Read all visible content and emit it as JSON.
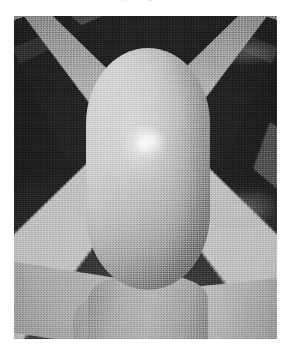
{
  "page": {
    "background_color": "#ffffff",
    "width": 291,
    "height": 353
  },
  "clipped_caption": {
    "text": "ted  from   the   supporting   surface",
    "note": "bottom sliver of a text line cropped at the top edge"
  },
  "figure": {
    "frame": {
      "left": 14,
      "top": 16,
      "width": 263,
      "height": 323,
      "border_color": "#ffffff"
    },
    "kind": "grayscale-3d-render",
    "palette": {
      "tile_dark": "#3a3a3a",
      "grout_light": "#cdcdcd",
      "floor_mid": "#a3a3a3",
      "object_light": "#d8d8d8",
      "object_mid": "#c2c2c2",
      "object_shadow": "#9d9d9d",
      "highlight": "#ffffff",
      "contact_shadow": "#373737"
    },
    "objects": [
      {
        "name": "capsule",
        "shape": "rounded ovoid / capsule",
        "material": "matte-glossy light gray",
        "bounds": {
          "left": 72,
          "top": 32,
          "width": 124,
          "height": 242
        }
      },
      {
        "name": "specular-highlight",
        "shape": "ellipse",
        "bounds": {
          "left": 118,
          "top": 110,
          "width": 34,
          "height": 30
        }
      },
      {
        "name": "pedestal",
        "shape": "tapered stem meeting the floor",
        "bounds": {
          "left": 74,
          "top": 258,
          "width": 120,
          "height": 70
        }
      },
      {
        "name": "contact-shadow",
        "shape": "soft ellipse",
        "bounds": {
          "left": 52,
          "top": 248,
          "width": 166,
          "height": 54
        }
      }
    ],
    "floor": {
      "pattern": "diamond tiles in one-point perspective",
      "tile_color": "#3a3a3a",
      "seam_color": "#cdcdcd",
      "horizon_hint": "above the top edge of the frame"
    }
  }
}
